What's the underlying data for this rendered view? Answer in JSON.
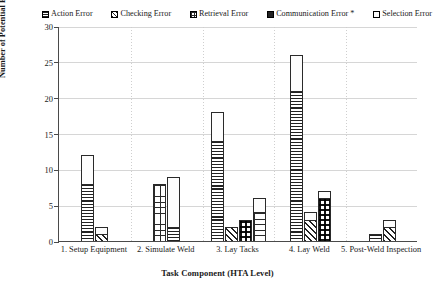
{
  "chart_data": {
    "type": "bar",
    "title": "",
    "xlabel": "Task Component (HTA Level)",
    "ylabel": "Number of Potential Errors",
    "ylim": [
      0,
      30
    ],
    "ytick_step": 5,
    "yticks": [
      "0",
      "5",
      "10",
      "15",
      "20",
      "25",
      "30"
    ],
    "grid": "horizontal-and-vertical-dotted",
    "legend_position": "top",
    "stacked": true,
    "categories": [
      "1. Setup Equipment",
      "2. Simulate Weld",
      "3. Lay Tacks",
      "4. Lay Weld",
      "5. Post-Weld Inspection"
    ],
    "series": [
      {
        "name": "Action Error",
        "pattern": "horizontal-lines"
      },
      {
        "name": "Checking Error",
        "pattern": "diagonal-lines"
      },
      {
        "name": "Retrieval Error",
        "pattern": "grid-lines"
      },
      {
        "name": "Communication Error *",
        "pattern": "checkerboard"
      },
      {
        "name": "Selection Error",
        "pattern": "solid-white"
      }
    ],
    "groups": [
      {
        "category": "1. Setup Equipment",
        "bars": [
          {
            "total": 12,
            "segments": [
              {
                "series": "Action Error",
                "value": 8
              },
              {
                "series": "Selection Error",
                "value": 4
              }
            ]
          },
          {
            "total": 2,
            "segments": [
              {
                "series": "Checking Error",
                "value": 1
              },
              {
                "series": "Selection Error",
                "value": 1
              }
            ]
          }
        ]
      },
      {
        "category": "2. Simulate Weld",
        "bars": [
          {
            "total": 8,
            "segments": [
              {
                "series": "Retrieval Error",
                "value": 8
              }
            ]
          },
          {
            "total": 9,
            "segments": [
              {
                "series": "Action Error",
                "value": 2
              },
              {
                "series": "Selection Error",
                "value": 7
              }
            ]
          }
        ]
      },
      {
        "category": "3. Lay Tacks",
        "bars": [
          {
            "total": 18,
            "segments": [
              {
                "series": "Action Error",
                "value": 14
              },
              {
                "series": "Selection Error",
                "value": 4
              }
            ]
          },
          {
            "total": 2,
            "segments": [
              {
                "series": "Checking Error",
                "value": 2
              }
            ]
          },
          {
            "total": 3,
            "segments": [
              {
                "series": "Communication Error *",
                "value": 3
              }
            ]
          },
          {
            "total": 6,
            "segments": [
              {
                "series": "Retrieval Error",
                "value": 4
              },
              {
                "series": "Selection Error",
                "value": 2
              }
            ]
          }
        ]
      },
      {
        "category": "4. Lay Weld",
        "bars": [
          {
            "total": 26,
            "segments": [
              {
                "series": "Action Error",
                "value": 21
              },
              {
                "series": "Selection Error",
                "value": 5
              }
            ]
          },
          {
            "total": 4,
            "segments": [
              {
                "series": "Checking Error",
                "value": 3
              },
              {
                "series": "Selection Error",
                "value": 1
              }
            ]
          },
          {
            "total": 7,
            "segments": [
              {
                "series": "Communication Error *",
                "value": 6
              },
              {
                "series": "Selection Error",
                "value": 1
              }
            ]
          }
        ]
      },
      {
        "category": "5. Post-Weld Inspection",
        "bars": [
          {
            "total": 1,
            "segments": [
              {
                "series": "Action Error",
                "value": 1
              }
            ]
          },
          {
            "total": 3,
            "segments": [
              {
                "series": "Checking Error",
                "value": 2
              },
              {
                "series": "Selection Error",
                "value": 1
              }
            ]
          }
        ]
      }
    ]
  },
  "legend": {
    "items": [
      {
        "label": "Action Error",
        "icon": "hatch-horizontal-swatch-icon"
      },
      {
        "label": "Checking Error",
        "icon": "hatch-diagonal-swatch-icon"
      },
      {
        "label": "Retrieval Error",
        "icon": "hatch-grid-swatch-icon"
      },
      {
        "label": "Communication Error *",
        "icon": "hatch-solid-swatch-icon"
      },
      {
        "label": "Selection Error",
        "icon": "hatch-white-swatch-icon"
      }
    ]
  },
  "axes": {
    "y_title": "Number of Potential Errors",
    "x_title": "Task Component (HTA Level)",
    "y_ticks": [
      "0",
      "5",
      "10",
      "15",
      "20",
      "25",
      "30"
    ],
    "x_categories": [
      "1. Setup Equipment",
      "2. Simulate Weld",
      "3. Lay Tacks",
      "4. Lay Weld",
      "5. Post-Weld Inspection"
    ]
  }
}
